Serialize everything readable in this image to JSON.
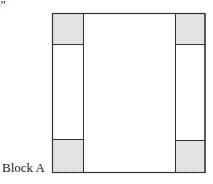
{
  "diagram": {
    "dimension_label": "9\"",
    "block_label": "Block A",
    "colors": {
      "outline": "#333333",
      "shaded_fill": "#e6e6e6",
      "background": "#ffffff"
    },
    "parts": [
      {
        "name": "corner-square-top-left",
        "shaded": true
      },
      {
        "name": "corner-square-top-right",
        "shaded": true
      },
      {
        "name": "corner-square-bottom-left",
        "shaded": true
      },
      {
        "name": "corner-square-bottom-right",
        "shaded": true
      },
      {
        "name": "side-strip-left",
        "shaded": false
      },
      {
        "name": "side-strip-right",
        "shaded": false
      },
      {
        "name": "center-rectangle",
        "shaded": false
      }
    ]
  }
}
